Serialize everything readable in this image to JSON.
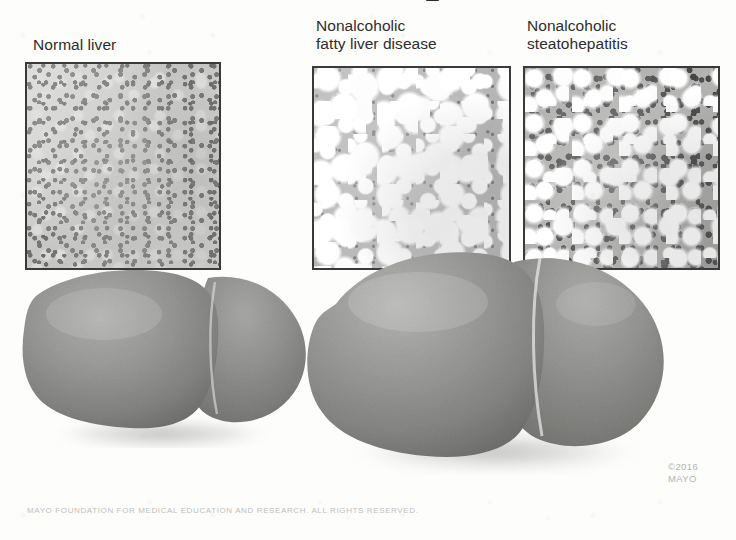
{
  "figure": {
    "domain": "medical-illustration",
    "title_fragment_visible": true,
    "background_color": "#fdfdfc"
  },
  "captions": {
    "normal": "Normal liver",
    "nafld": "Nonalcoholic\nfatty liver disease",
    "nash": "Nonalcoholic\nsteatohepatitis"
  },
  "panels": [
    {
      "id": "panel-normal",
      "caption_key": "normal",
      "description": "Uniform pale liver parenchyma with evenly scattered small dark hepatocyte nuclei; no fat vacuoles.",
      "border_color": "#3a3a3a",
      "base_color": "#c8c8c6"
    },
    {
      "id": "panel-nafld",
      "caption_key": "nafld",
      "description": "Numerous large round white lipid vacuoles filling hepatocytes (macrovesicular steatosis), compressed gray cytoplasm between them.",
      "border_color": "#3a3a3a",
      "base_color": "#b6b6b6"
    },
    {
      "id": "panel-nash",
      "caption_key": "nash",
      "description": "Fat vacuoles mixed with dense dark inflammatory cell infiltrate and ballooned hepatocytes; heterogeneous appearance.",
      "border_color": "#3a3a3a",
      "base_color": "#a8a8a6"
    }
  ],
  "organs": [
    {
      "id": "liver-normal",
      "label": "normal-liver-organ",
      "relative_size": "normal",
      "fill_color": "#8e8e8c",
      "description": "Two-lobed liver of normal size, smooth grayish-brown surface with drop shadow."
    },
    {
      "id": "liver-fatty",
      "label": "enlarged-fatty-liver-organ",
      "relative_size": "enlarged",
      "fill_color": "#929290",
      "description": "Enlarged, rounded and swollen liver with bulging lobes and prominent interlobar fissure."
    }
  ],
  "credits": {
    "copyright": "©2016\nMAYO",
    "footer": "MAYO FOUNDATION FOR MEDICAL EDUCATION AND RESEARCH. ALL RIGHTS RESERVED."
  }
}
